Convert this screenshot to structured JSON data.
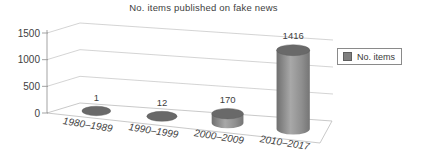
{
  "title": "No. items published on fake news",
  "legend": {
    "label": "No. items",
    "position": "right",
    "marker_color": "#7f7f7f"
  },
  "colors": {
    "text": "#3e3e3e",
    "grid": "#c9c9c9",
    "axis": "#999999",
    "floor_edge": "#bbbbbb",
    "cylinder_top": "#696969",
    "cylinder_body_dark": "#6f6f6f",
    "cylinder_body_light": "#a8a8a8",
    "cylinder_body_shade": "#757575",
    "background": "#ffffff"
  },
  "chart_data": {
    "type": "bar",
    "subtype": "3d-cylinder",
    "title": "No. items published on fake news",
    "categories": [
      "1980–1989",
      "1990–1999",
      "2000–2009",
      "2010–2017"
    ],
    "series": [
      {
        "name": "No. items",
        "values": [
          1,
          12,
          170,
          1416
        ]
      }
    ],
    "value_labels": [
      "1",
      "12",
      "170",
      "1416"
    ],
    "xlabel": "",
    "ylabel": "",
    "yticks": [
      0,
      500,
      1000,
      1500
    ],
    "ylim": [
      0,
      1500
    ],
    "grid": true,
    "legend_position": "right",
    "data_labels": "outside-end"
  }
}
